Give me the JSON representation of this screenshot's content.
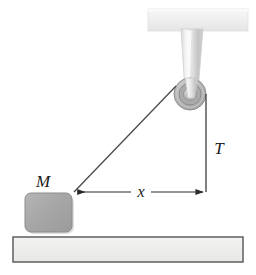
{
  "figure": {
    "canvas": {
      "width": 256,
      "height": 275,
      "background": "#ffffff"
    },
    "labels": {
      "mass": "M",
      "distance": "x",
      "tension": "T"
    },
    "colors": {
      "rope": "#4a4a4a",
      "block_fill": "#a9a9a9",
      "block_edge": "#8c8c8c",
      "ground_fill": "#eeeeec",
      "ground_edge": "#555555",
      "pulley_rim": "#b9b9b9",
      "pulley_groove": "#9a9a9a",
      "pulley_hub": "#c9c9c9",
      "bracket_light": "#f2f2f2",
      "bracket_dark": "#bdbdbd",
      "ceiling_fill": "#f1f1f1",
      "arrow": "#2a2a2a"
    },
    "elements": {
      "ceiling_bar": {
        "x": 148,
        "y": 9,
        "width": 100,
        "height": 22
      },
      "bracket": {
        "top_x": 181,
        "top_width": 22,
        "bottom_x": 185,
        "bottom_width": 13,
        "top_y": 29,
        "bottom_y": 92
      },
      "pulley": {
        "cx": 190,
        "cy": 94,
        "r_outer": 16,
        "r_groove": 11,
        "r_hub": 6
      },
      "block": {
        "x": 25,
        "y": 193,
        "width": 47,
        "height": 39,
        "corner_radius": 6
      },
      "ground": {
        "x": 13,
        "y": 237,
        "width": 230,
        "height": 25
      },
      "rope_diagonal": {
        "x1": 176,
        "y1": 86,
        "x2": 74,
        "y2": 192
      },
      "rope_vertical": {
        "x1": 206,
        "y1": 94,
        "x2": 206,
        "y2": 192
      },
      "dimension_arrow": {
        "x1": 74,
        "y1": 192,
        "x2": 206,
        "y2": 192
      }
    },
    "label_positions": {
      "mass": {
        "x": 43,
        "y": 187
      },
      "distance": {
        "x": 141,
        "y": 196
      },
      "tension": {
        "x": 219,
        "y": 154
      }
    }
  }
}
